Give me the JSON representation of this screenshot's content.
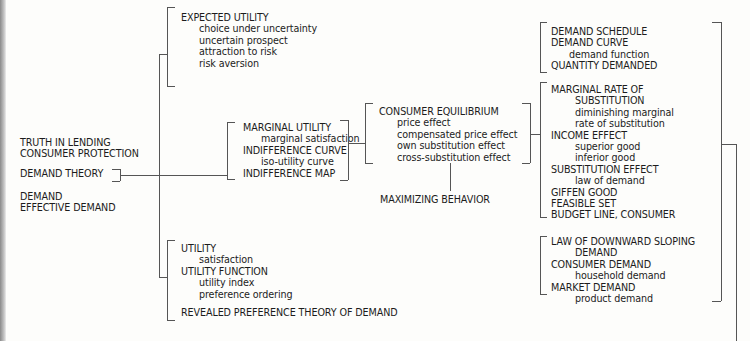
{
  "diagram": {
    "root_group": {
      "items": [
        {
          "label": "TRUTH IN LENDING"
        },
        {
          "label": "CONSUMER PROTECTION"
        },
        {
          "label": "DEMAND THEORY"
        },
        {
          "label": "DEMAND"
        },
        {
          "label": "EFFECTIVE DEMAND"
        }
      ]
    },
    "expected_utility": {
      "title": "EXPECTED UTILITY",
      "subs": [
        "choice under uncertainty",
        "uncertain prospect",
        "attraction to risk",
        "risk aversion"
      ]
    },
    "marginal_utility": {
      "items": [
        {
          "label": "MARGINAL UTILITY",
          "sub": "marginal satisfaction"
        },
        {
          "label": "INDIFFERENCE CURVE",
          "sub": "iso-utility curve"
        },
        {
          "label": "INDIFFERENCE MAP"
        }
      ]
    },
    "utility": {
      "items": [
        {
          "label": "UTILITY",
          "sub": "satisfaction"
        },
        {
          "label": "UTILITY FUNCTION",
          "subs": [
            "utility index",
            "preference ordering"
          ]
        }
      ],
      "revealed": "REVEALED PREFERENCE THEORY OF DEMAND"
    },
    "consumer_equilibrium": {
      "title": "CONSUMER EQUILIBRIUM",
      "subs": [
        "price effect",
        "compensated price effect",
        "own substitution effect",
        "cross-substitution effect"
      ],
      "below": "MAXIMIZING BEHAVIOR"
    },
    "demand_schedule": {
      "items": [
        "DEMAND SCHEDULE",
        "DEMAND CURVE"
      ],
      "sub": "demand function",
      "last": "QUANTITY DEMANDED"
    },
    "mrs": {
      "title1": "MARGINAL RATE OF",
      "title2": "SUBSTITUTION",
      "sub1": "diminishing marginal",
      "sub2": "rate of substitution",
      "income": "INCOME EFFECT",
      "income_subs": [
        "superior good",
        "inferior good"
      ],
      "substitution": "SUBSTITUTION EFFECT",
      "substitution_sub": "law of demand",
      "rest": [
        "GIFFEN GOOD",
        "FEASIBLE SET",
        "BUDGET LINE, CONSUMER"
      ]
    },
    "law_of_demand": {
      "title1": "LAW OF DOWNWARD SLOPING",
      "title2": "DEMAND",
      "consumer": "CONSUMER DEMAND",
      "consumer_sub": "household demand",
      "market": "MARKET DEMAND",
      "market_sub": "product demand"
    },
    "colors": {
      "line": "#555555",
      "text": "#1c1c1c",
      "background": "#fdfdfb"
    }
  }
}
